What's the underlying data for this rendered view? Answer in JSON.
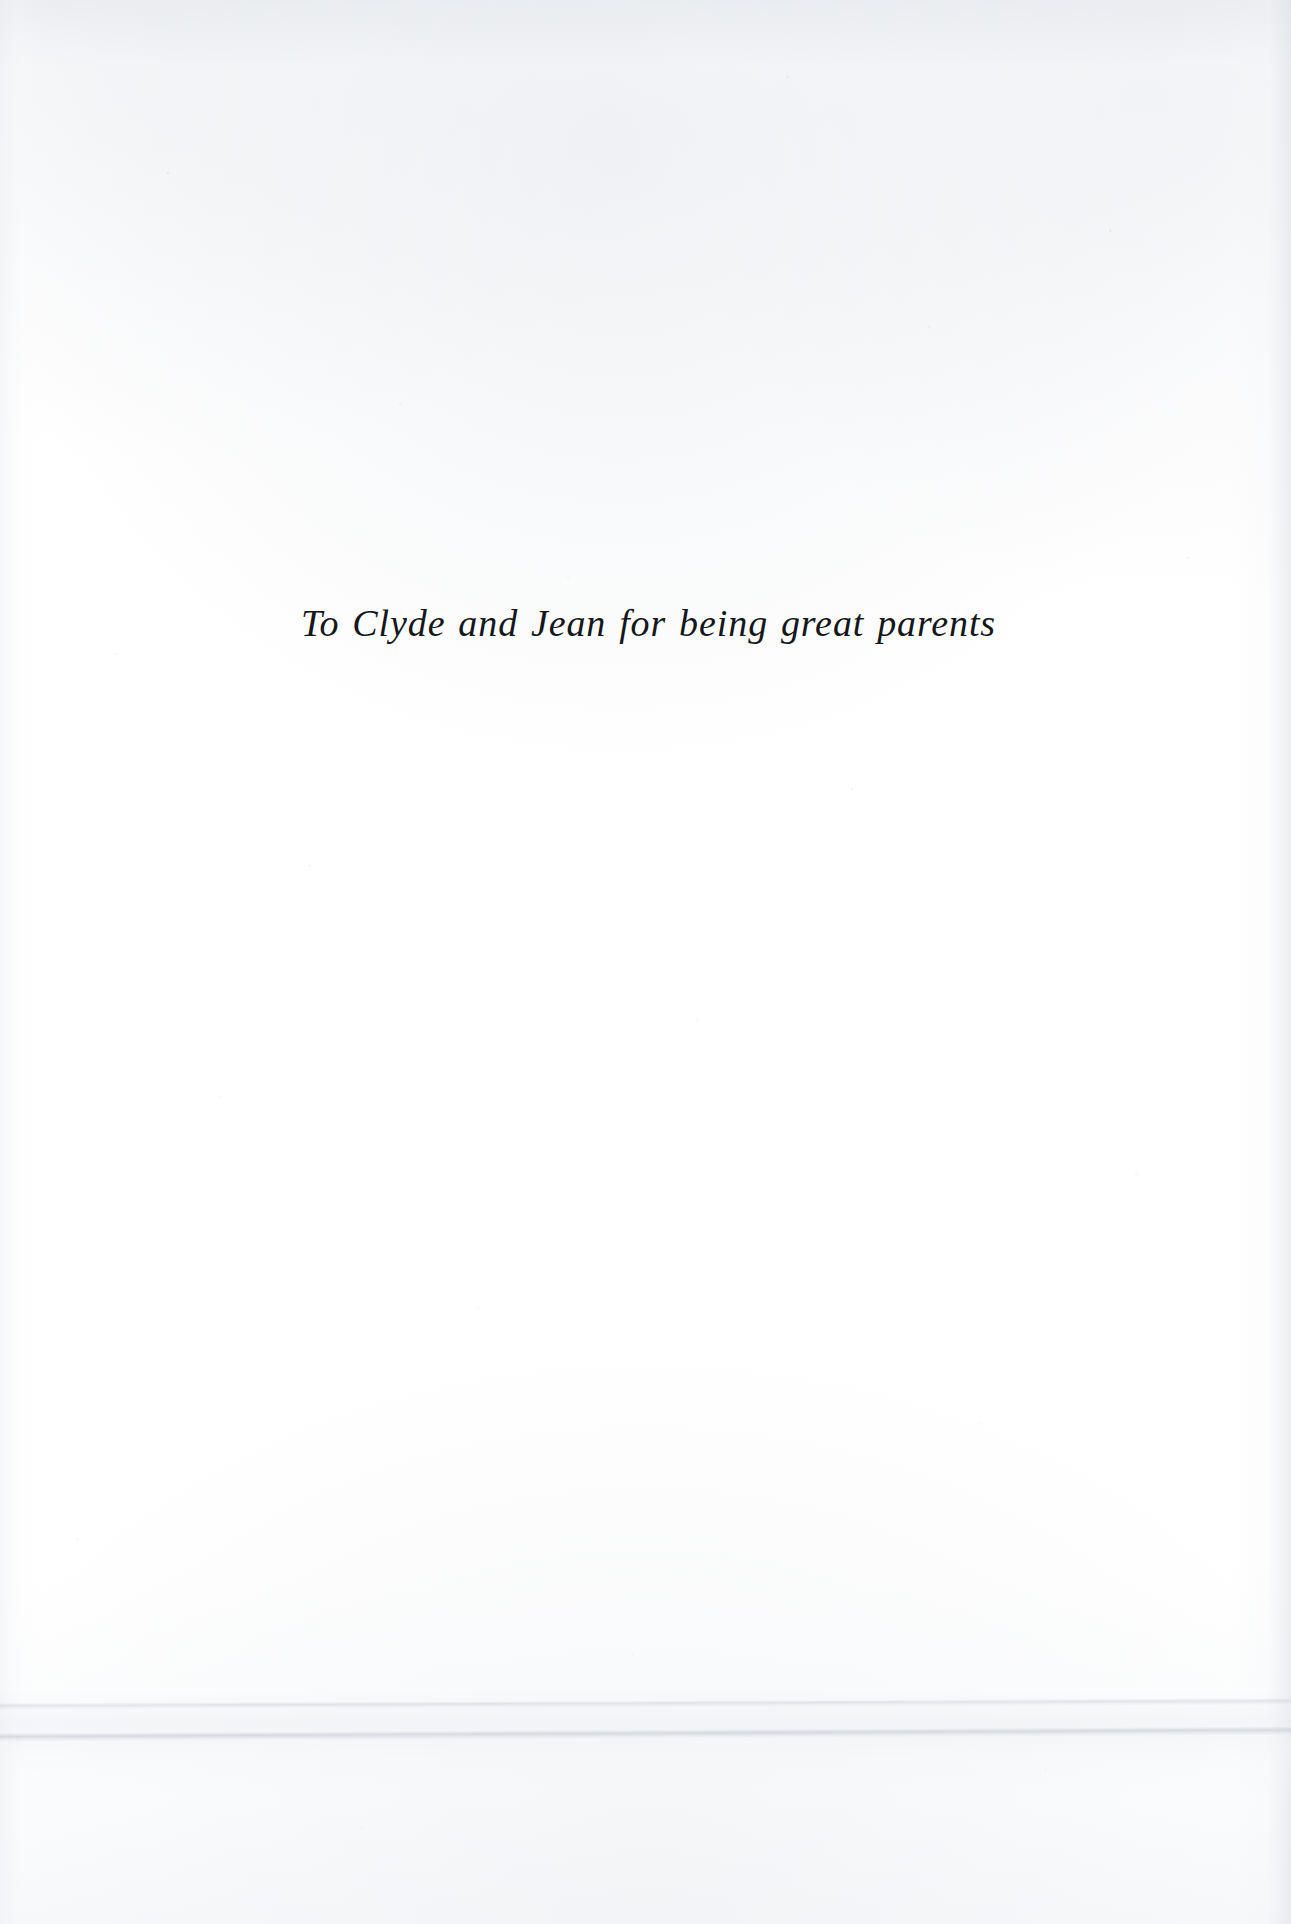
{
  "page": {
    "type": "book-dedication-page",
    "background_color": "#ffffff",
    "text_color": "#15171a",
    "width": 1291,
    "height": 1924
  },
  "dedication": {
    "text": "To Clyde and Jean for being great parents",
    "style": "italic-serif",
    "alignment": "center"
  },
  "artifacts": {
    "crease_label": "",
    "speckle_label": ""
  }
}
